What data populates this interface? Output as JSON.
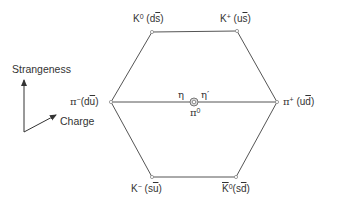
{
  "diagram": {
    "colors": {
      "line": "#555555",
      "text": "#333333",
      "vertex": "#888888",
      "background": "#ffffff"
    },
    "axes": {
      "vertical_label": "Strangeness",
      "diagonal_label": "Charge"
    },
    "particles": {
      "k0": {
        "symbol": "K",
        "sup": "0",
        "quarks_pre": "(d",
        "quarks_bar": "s",
        "quarks_post": ")"
      },
      "kplus": {
        "symbol": "K",
        "sup": "+",
        "quarks_pre": "(u",
        "quarks_bar": "s",
        "quarks_post": ")"
      },
      "piminus": {
        "symbol": "π",
        "sup": "−",
        "quarks_pre": "(d",
        "quarks_bar": "u",
        "quarks_post": ")"
      },
      "piplus": {
        "symbol": "π",
        "sup": "+",
        "quarks_pre": "(u",
        "quarks_bar": "d",
        "quarks_post": ")"
      },
      "kminus": {
        "symbol": "K",
        "sup": "−",
        "quarks_pre": "(s",
        "quarks_bar": "u",
        "quarks_post": ")"
      },
      "k0bar": {
        "symbol": "K",
        "sup": "0",
        "quarks_pre": "(s",
        "quarks_bar": "d",
        "quarks_post": ")"
      },
      "eta": {
        "symbol": "η"
      },
      "etaprime": {
        "symbol": "η′"
      },
      "pi0": {
        "symbol": "π",
        "sup": "0"
      }
    },
    "geometry": {
      "vertices": {
        "top_left": [
          152,
          32
        ],
        "top_right": [
          237,
          31
        ],
        "left": [
          111,
          102
        ],
        "right": [
          277,
          102
        ],
        "bottom_left": [
          152,
          177
        ],
        "bottom_right": [
          236,
          177
        ]
      },
      "center": [
        194,
        102
      ]
    }
  }
}
